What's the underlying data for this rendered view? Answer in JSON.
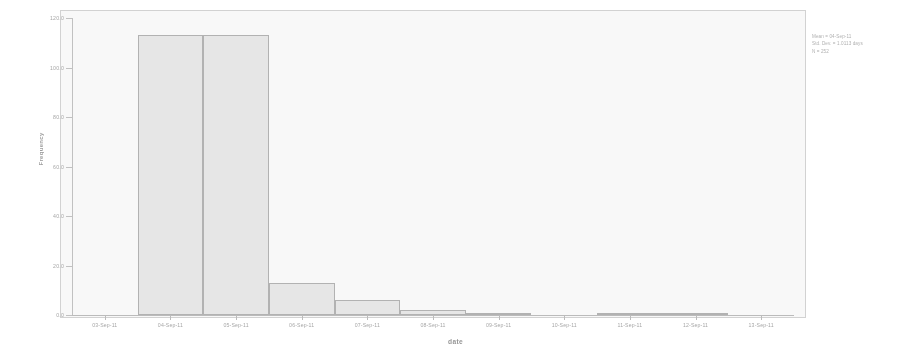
{
  "chart_data": {
    "type": "bar",
    "title": "",
    "subtitle": "",
    "xlabel": "date",
    "ylabel": "Frequency",
    "categories": [
      "03-Sep-11",
      "04-Sep-11",
      "05-Sep-11",
      "06-Sep-11",
      "07-Sep-11",
      "08-Sep-11",
      "09-Sep-11",
      "10-Sep-11",
      "11-Sep-11",
      "12-Sep-11",
      "13-Sep-11"
    ],
    "values": [
      0,
      113,
      113,
      13,
      6,
      2,
      1,
      0,
      1,
      1,
      0
    ],
    "ylim": [
      0,
      120
    ],
    "yticks": [
      0,
      20,
      40,
      60,
      80,
      100,
      120
    ],
    "ytick_labels": [
      "0.0",
      "20.0",
      "40.0",
      "60.0",
      "80.0",
      "100.0",
      "120.0"
    ],
    "grid": false,
    "legend": "none",
    "bar_fill_color": "#e2e2e2",
    "bar_border_color": "#8f8f8f",
    "axis_color": "#9e9e9e",
    "text_color": "#7a7a7a"
  },
  "annotation": {
    "mean": "Mean = 04-Sep-11",
    "std_dev": "Std. Dev. = 1.0113 days",
    "n": "N = 252"
  }
}
